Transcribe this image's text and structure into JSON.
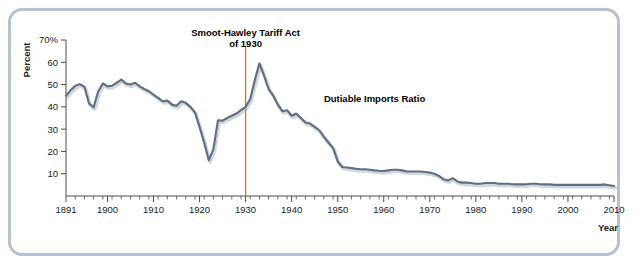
{
  "chart_data": {
    "type": "line",
    "title": "",
    "xlabel": "Year",
    "ylabel": "Percent",
    "xlim": [
      1891,
      2010
    ],
    "ylim": [
      0,
      70
    ],
    "grid": false,
    "legend_position": "inline-annotation",
    "series": [
      {
        "name": "Dutiable Imports Ratio",
        "color": "#5e6f82",
        "x": [
          1891,
          1892,
          1893,
          1894,
          1895,
          1896,
          1897,
          1898,
          1899,
          1900,
          1901,
          1902,
          1903,
          1904,
          1905,
          1906,
          1907,
          1908,
          1909,
          1910,
          1911,
          1912,
          1913,
          1914,
          1915,
          1916,
          1917,
          1918,
          1919,
          1920,
          1921,
          1922,
          1923,
          1924,
          1925,
          1926,
          1927,
          1928,
          1929,
          1930,
          1931,
          1932,
          1933,
          1934,
          1935,
          1936,
          1937,
          1938,
          1939,
          1940,
          1941,
          1942,
          1943,
          1944,
          1945,
          1946,
          1947,
          1948,
          1949,
          1950,
          1951,
          1952,
          1953,
          1954,
          1955,
          1956,
          1957,
          1958,
          1959,
          1960,
          1961,
          1962,
          1963,
          1964,
          1965,
          1966,
          1967,
          1968,
          1969,
          1970,
          1971,
          1972,
          1973,
          1974,
          1975,
          1976,
          1977,
          1978,
          1979,
          1980,
          1981,
          1982,
          1983,
          1984,
          1985,
          1986,
          1987,
          1988,
          1989,
          1990,
          1991,
          1992,
          1993,
          1994,
          1995,
          1996,
          1997,
          1998,
          1999,
          2000,
          2001,
          2002,
          2003,
          2004,
          2005,
          2006,
          2007,
          2008,
          2009,
          2010
        ],
        "values": [
          45.0,
          47.5,
          49.5,
          50.2,
          49.0,
          41.5,
          39.8,
          47.0,
          50.5,
          49.2,
          49.5,
          50.8,
          52.2,
          50.5,
          50.0,
          50.8,
          49.2,
          48.0,
          47.0,
          45.5,
          44.0,
          42.5,
          42.8,
          41.0,
          40.5,
          42.5,
          41.8,
          40.0,
          37.5,
          31.0,
          24.0,
          16.0,
          21.0,
          34.0,
          33.8,
          35.0,
          36.0,
          37.0,
          38.5,
          40.0,
          43.5,
          52.0,
          59.5,
          54.0,
          48.0,
          45.0,
          41.0,
          38.0,
          38.5,
          36.0,
          37.0,
          35.0,
          33.0,
          32.5,
          31.0,
          29.5,
          26.5,
          24.0,
          21.5,
          15.5,
          13.0,
          12.8,
          12.5,
          12.2,
          12.0,
          12.0,
          11.8,
          11.5,
          11.3,
          11.2,
          11.5,
          11.8,
          11.8,
          11.5,
          11.0,
          11.0,
          11.0,
          11.0,
          10.8,
          10.5,
          10.0,
          9.0,
          7.5,
          7.0,
          8.0,
          6.5,
          6.0,
          6.0,
          5.8,
          5.5,
          5.5,
          5.8,
          5.8,
          5.8,
          5.5,
          5.5,
          5.5,
          5.3,
          5.2,
          5.2,
          5.3,
          5.5,
          5.5,
          5.3,
          5.2,
          5.2,
          5.0,
          5.0,
          5.0,
          5.0,
          5.0,
          5.0,
          5.0,
          5.0,
          5.0,
          5.0,
          5.0,
          5.2,
          4.8,
          4.5
        ]
      }
    ],
    "y_ticks": [
      "70%",
      "60",
      "50",
      "40",
      "30",
      "20",
      "10"
    ],
    "y_tick_values": [
      70,
      60,
      50,
      40,
      30,
      20,
      10
    ],
    "x_ticks": [
      "1891",
      "1900",
      "1910",
      "1920",
      "1930",
      "1940",
      "1950",
      "1960",
      "1970",
      "1980",
      "1990",
      "2000",
      "2010"
    ],
    "x_tick_values": [
      1891,
      1900,
      1910,
      1920,
      1930,
      1940,
      1950,
      1960,
      1970,
      1980,
      1990,
      2000,
      2010
    ],
    "annotations": [
      {
        "name": "smoot-hawley-marker",
        "line1": "Smoot-Hawley Tariff Act",
        "line2": "of 1930",
        "x_value": 1930,
        "color": "#c1852f"
      },
      {
        "name": "series-inline-label",
        "text": "Dutiable Imports Ratio",
        "x_value": 1947,
        "y_value": 42
      }
    ]
  },
  "frame": {
    "border_color": "#b6c0d2"
  }
}
